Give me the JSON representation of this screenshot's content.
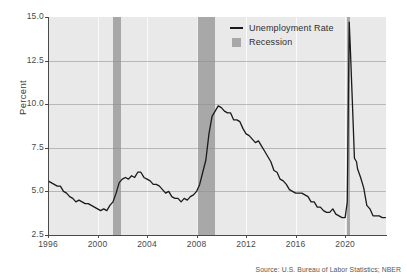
{
  "chart_data": {
    "type": "line",
    "title": "",
    "xlabel": "",
    "ylabel": "Percent",
    "xlim": [
      1996.0,
      2023.3
    ],
    "ylim": [
      2.5,
      15.0
    ],
    "grid": true,
    "legend_position": "top-right",
    "y_ticks": [
      "15.0",
      "12.5",
      "10.0",
      "7.5",
      "5.0",
      "2.5"
    ],
    "y_tick_values": [
      15.0,
      12.5,
      10.0,
      7.5,
      5.0,
      2.5
    ],
    "x_ticks": [
      "1996",
      "2000",
      "2004",
      "2008",
      "2012",
      "2016",
      "2020"
    ],
    "x_tick_values": [
      1996,
      2000,
      2004,
      2008,
      2012,
      2016,
      2020
    ],
    "series": [
      {
        "name": "Unemployment Rate",
        "color": "#1a1a1a",
        "units": "percent",
        "x": [
          1996.0,
          1996.25,
          1996.5,
          1996.75,
          1997.0,
          1997.25,
          1997.5,
          1997.75,
          1998.0,
          1998.25,
          1998.5,
          1998.75,
          1999.0,
          1999.25,
          1999.5,
          1999.75,
          2000.0,
          2000.25,
          2000.5,
          2000.75,
          2001.0,
          2001.25,
          2001.5,
          2001.75,
          2002.0,
          2002.25,
          2002.5,
          2002.75,
          2003.0,
          2003.25,
          2003.5,
          2003.75,
          2004.0,
          2004.25,
          2004.5,
          2004.75,
          2005.0,
          2005.25,
          2005.5,
          2005.75,
          2006.0,
          2006.25,
          2006.5,
          2006.75,
          2007.0,
          2007.25,
          2007.5,
          2007.75,
          2008.0,
          2008.25,
          2008.5,
          2008.75,
          2009.0,
          2009.25,
          2009.5,
          2009.75,
          2010.0,
          2010.25,
          2010.5,
          2010.75,
          2011.0,
          2011.25,
          2011.5,
          2011.75,
          2012.0,
          2012.25,
          2012.5,
          2012.75,
          2013.0,
          2013.25,
          2013.5,
          2013.75,
          2014.0,
          2014.25,
          2014.5,
          2014.75,
          2015.0,
          2015.25,
          2015.5,
          2015.75,
          2016.0,
          2016.25,
          2016.5,
          2016.75,
          2017.0,
          2017.25,
          2017.5,
          2017.75,
          2018.0,
          2018.25,
          2018.5,
          2018.75,
          2019.0,
          2019.25,
          2019.5,
          2019.75,
          2020.0,
          2020.17,
          2020.33,
          2020.42,
          2020.58,
          2020.75,
          2020.92,
          2021.0,
          2021.25,
          2021.5,
          2021.75,
          2022.0,
          2022.25,
          2022.5,
          2022.75,
          2023.0,
          2023.25
        ],
        "y": [
          5.6,
          5.5,
          5.4,
          5.3,
          5.3,
          5.0,
          4.9,
          4.7,
          4.6,
          4.4,
          4.5,
          4.4,
          4.3,
          4.3,
          4.2,
          4.1,
          4.0,
          3.9,
          4.0,
          3.9,
          4.2,
          4.4,
          4.9,
          5.5,
          5.7,
          5.8,
          5.7,
          5.9,
          5.8,
          6.1,
          6.1,
          5.8,
          5.7,
          5.6,
          5.4,
          5.4,
          5.3,
          5.1,
          4.9,
          5.0,
          4.7,
          4.6,
          4.6,
          4.4,
          4.6,
          4.5,
          4.7,
          4.8,
          5.0,
          5.4,
          6.1,
          6.8,
          8.3,
          9.3,
          9.6,
          9.9,
          9.8,
          9.6,
          9.5,
          9.5,
          9.1,
          9.1,
          9.0,
          8.6,
          8.3,
          8.2,
          8.0,
          7.8,
          7.9,
          7.6,
          7.3,
          7.0,
          6.7,
          6.2,
          6.1,
          5.7,
          5.6,
          5.4,
          5.1,
          5.0,
          4.9,
          4.9,
          4.9,
          4.8,
          4.7,
          4.4,
          4.4,
          4.1,
          4.1,
          3.9,
          3.8,
          3.8,
          4.0,
          3.7,
          3.6,
          3.5,
          3.5,
          4.4,
          14.7,
          13.2,
          10.2,
          6.9,
          6.7,
          6.3,
          5.8,
          5.2,
          4.2,
          4.0,
          3.6,
          3.6,
          3.6,
          3.5,
          3.5
        ],
        "notes": {
          "peak_2003": 6.3,
          "trough_2007": 4.4,
          "peak_2009": 10.0,
          "trough_2019": 3.5,
          "peak_2020_covid": 14.7,
          "value_2023_end": 3.5
        }
      }
    ],
    "shaded_regions": [
      {
        "name": "Recession",
        "label": "Recession",
        "color": "#a8a8a8",
        "start": 2001.25,
        "end": 2001.92
      },
      {
        "name": "Recession",
        "label": "Recession",
        "color": "#a8a8a8",
        "start": 2008.0,
        "end": 2009.5
      },
      {
        "name": "Recession",
        "label": "Recession",
        "color": "#a8a8a8",
        "start": 2020.17,
        "end": 2020.42
      }
    ],
    "legend": [
      {
        "label": "Unemployment Rate",
        "key": "line",
        "color": "#1a1a1a"
      },
      {
        "label": "Recession",
        "key": "swatch",
        "color": "#a8a8a8"
      }
    ],
    "source_note": "Source: U.S. Bureau of Labor Statistics; NBER",
    "background_color": "#e9e9e9",
    "page_background": "#ffffff",
    "gridline_color": "#8e8e8e",
    "axis_color": "#4a4a4a"
  }
}
